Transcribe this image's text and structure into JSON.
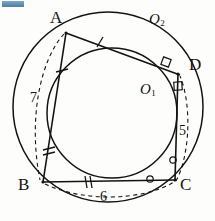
{
  "figure": {
    "background_color": "#fdfdfb",
    "stroke_color": "#15130f",
    "vertices": {
      "A": {
        "label": "A",
        "x": 66,
        "y": 33,
        "label_x": 50,
        "label_y": 9
      },
      "B": {
        "label": "B",
        "x": 43,
        "y": 182,
        "label_x": 20,
        "label_y": 178
      },
      "C": {
        "label": "C",
        "x": 175,
        "y": 180,
        "label_x": 180,
        "label_y": 178
      },
      "D": {
        "label": "D",
        "x": 178,
        "y": 73,
        "label_x": 188,
        "label_y": 57
      }
    },
    "centers": {
      "outer": {
        "label": "O",
        "sub": "2",
        "label_x": 149,
        "label_y": 13
      },
      "inner": {
        "label": "O",
        "sub": "1",
        "label_x": 140,
        "label_y": 83
      }
    },
    "lengths": {
      "AB": {
        "value": "7",
        "x": 32,
        "y": 92
      },
      "CD": {
        "value": "5",
        "x": 180,
        "y": 125
      },
      "BC": {
        "value": "6",
        "x": 103,
        "y": 190
      }
    },
    "circles": {
      "circumcircle": {
        "cx": 108,
        "cy": 107,
        "r": 96,
        "name": "O2"
      },
      "incircle": {
        "cx": 111,
        "cy": 112,
        "r": 66,
        "name": "O1"
      }
    },
    "tick_marks": [
      {
        "name": "tick-on-AD",
        "count": 1,
        "x": 100,
        "y": 42
      },
      {
        "name": "tick-on-AB-upper",
        "count": 1,
        "x": 62,
        "y": 71
      },
      {
        "name": "tick-on-AB-lower",
        "count": 2,
        "x": 49,
        "y": 151
      },
      {
        "name": "tick-on-BC",
        "count": 2,
        "x": 88,
        "y": 182
      }
    ],
    "circle_marks": [
      {
        "name": "circle-mark-on-BC",
        "x": 150,
        "y": 179
      },
      {
        "name": "circle-mark-on-CD",
        "x": 173,
        "y": 160
      }
    ],
    "right_angles": [
      {
        "name": "right-angle-on-AD",
        "x": 166,
        "y": 62
      },
      {
        "name": "right-angle-at-D",
        "x": 178,
        "y": 86
      }
    ],
    "dashed_chords": [
      {
        "name": "dashed-arc-AB",
        "from": "A",
        "to": "B"
      },
      {
        "name": "dashed-arc-BC",
        "from": "B",
        "to": "C"
      },
      {
        "name": "dashed-arc-CD",
        "from": "C",
        "to": "D"
      }
    ],
    "sides": [
      {
        "name": "side-AB",
        "from": "A",
        "to": "B"
      },
      {
        "name": "side-BC",
        "from": "B",
        "to": "C"
      },
      {
        "name": "side-CD",
        "from": "C",
        "to": "D"
      },
      {
        "name": "side-AD",
        "from": "A",
        "to": "D"
      }
    ]
  }
}
